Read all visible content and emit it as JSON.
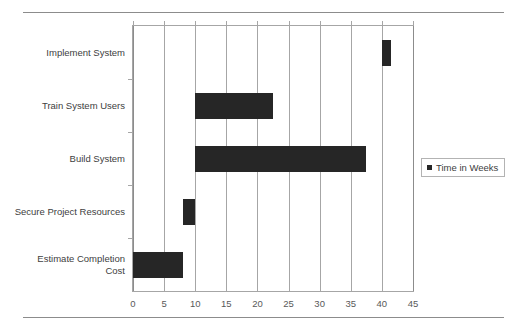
{
  "chart_data": {
    "type": "bar",
    "orientation": "horizontal",
    "title": "",
    "xlabel": "",
    "ylabel": "",
    "xlim": [
      0,
      45
    ],
    "xticks": [
      0,
      5,
      10,
      15,
      20,
      25,
      30,
      35,
      40,
      45
    ],
    "grid": "vertical",
    "legend_position": "right",
    "legend": [
      "Time in Weeks"
    ],
    "series_name": "Time in Weeks",
    "bar_color": "#262626",
    "categories": [
      "Implement System",
      "Train System Users",
      "Build System",
      "Secure Project Resources",
      "Estimate Completion\nCost"
    ],
    "bars": [
      {
        "category": "Implement System",
        "start": 40,
        "end": 41.5,
        "value": 1.5
      },
      {
        "category": "Train System Users",
        "start": 10,
        "end": 22.5,
        "value": 12.5
      },
      {
        "category": "Build System",
        "start": 10,
        "end": 37.5,
        "value": 27.5
      },
      {
        "category": "Secure Project Resources",
        "start": 8,
        "end": 10,
        "value": 2
      },
      {
        "category": "Estimate Completion Cost",
        "start": 0,
        "end": 8,
        "value": 8
      }
    ]
  },
  "axis": {
    "xtick_labels": [
      "0",
      "5",
      "10",
      "15",
      "20",
      "25",
      "30",
      "35",
      "40",
      "45"
    ]
  },
  "legend": {
    "entries": [
      {
        "label": "Time in Weeks",
        "marker": "square-marker"
      }
    ]
  }
}
